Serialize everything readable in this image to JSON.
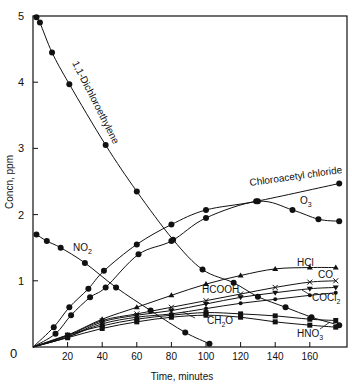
{
  "chart_data": {
    "type": "line",
    "title": "",
    "xlabel": "Time, minutes",
    "ylabel": "Concn, ppm",
    "xlim": [
      0,
      180
    ],
    "ylim": [
      0,
      5
    ],
    "x_ticks": [
      0,
      20,
      40,
      60,
      80,
      100,
      120,
      140,
      160
    ],
    "y_ticks": [
      1,
      2,
      3,
      4,
      5
    ],
    "grid": false,
    "series": [
      {
        "name": "1,1-Dichloroethylene",
        "marker": "circle",
        "x": [
          2,
          4,
          11,
          21,
          42,
          60,
          81,
          98,
          116,
          130,
          146,
          161,
          177
        ],
        "y": [
          4.98,
          4.9,
          4.45,
          3.97,
          3.05,
          2.35,
          1.62,
          1.17,
          0.97,
          0.76,
          0.6,
          0.45,
          0.33
        ]
      },
      {
        "name": "NO2",
        "marker": "circle",
        "x": [
          2,
          8,
          16,
          30,
          48,
          68,
          88,
          102
        ],
        "y": [
          1.7,
          1.6,
          1.5,
          1.27,
          0.9,
          0.55,
          0.22,
          0.05
        ]
      },
      {
        "name": "Chloroacetyl chloride",
        "marker": "circle",
        "x": [
          0,
          12,
          21,
          32,
          41,
          60,
          80,
          100,
          129,
          177
        ],
        "y": [
          0,
          0.3,
          0.6,
          0.88,
          1.15,
          1.55,
          1.85,
          2.07,
          2.2,
          2.47
        ]
      },
      {
        "name": "O3",
        "marker": "circle",
        "x": [
          0,
          13,
          22,
          33,
          42,
          61,
          80,
          100,
          130,
          150,
          165,
          177
        ],
        "y": [
          0,
          0.2,
          0.48,
          0.75,
          0.9,
          1.4,
          1.6,
          1.95,
          2.2,
          2.07,
          1.93,
          1.9
        ]
      },
      {
        "name": "HCl",
        "marker": "triangle",
        "x": [
          0,
          20,
          40,
          60,
          80,
          100,
          120,
          140,
          160,
          175
        ],
        "y": [
          0,
          0.18,
          0.42,
          0.6,
          0.78,
          0.95,
          1.08,
          1.18,
          1.2,
          1.2
        ]
      },
      {
        "name": "CO",
        "marker": "x",
        "x": [
          0,
          20,
          40,
          60,
          80,
          100,
          120,
          140,
          160,
          175
        ],
        "y": [
          0,
          0.17,
          0.4,
          0.5,
          0.6,
          0.7,
          0.8,
          0.9,
          0.98,
          1.0
        ]
      },
      {
        "name": "HCOOH",
        "marker": "triangle-down",
        "x": [
          0,
          20,
          40,
          60,
          80,
          100,
          120,
          140,
          160,
          175
        ],
        "y": [
          0,
          0.15,
          0.38,
          0.48,
          0.55,
          0.65,
          0.75,
          0.82,
          0.88,
          0.9
        ]
      },
      {
        "name": "COCl2",
        "marker": "small-circle",
        "x": [
          0,
          20,
          40,
          60,
          80,
          100,
          120,
          140,
          160,
          175
        ],
        "y": [
          0,
          0.15,
          0.35,
          0.45,
          0.5,
          0.58,
          0.66,
          0.72,
          0.78,
          0.82
        ]
      },
      {
        "name": "CH2O",
        "marker": "square",
        "x": [
          0,
          20,
          40,
          60,
          80,
          100,
          120,
          140,
          160,
          175
        ],
        "y": [
          0,
          0.18,
          0.32,
          0.42,
          0.48,
          0.52,
          0.5,
          0.47,
          0.42,
          0.4
        ]
      },
      {
        "name": "HNO3",
        "marker": "square",
        "x": [
          0,
          20,
          40,
          60,
          80,
          100,
          120,
          140,
          160,
          175
        ],
        "y": [
          0,
          0.14,
          0.28,
          0.38,
          0.45,
          0.48,
          0.45,
          0.38,
          0.33,
          0.3
        ]
      }
    ],
    "annotations": [
      {
        "text": "1,1-Dichloroethylene",
        "x": 24,
        "y": 4.0,
        "rotation": 62
      },
      {
        "text": "NO2",
        "x": 38,
        "y": 1.4
      },
      {
        "text": "Chloroacetyl chloride",
        "x": 118,
        "y": 2.35,
        "rotation": -10
      },
      {
        "text": "O3",
        "x": 153,
        "y": 2.12
      },
      {
        "text": "HCl",
        "x": 140,
        "y": 1.27
      },
      {
        "text": "CO",
        "x": 158,
        "y": 1.1
      },
      {
        "text": "HCOOH",
        "x": 88,
        "y": 0.9
      },
      {
        "text": "COCl2",
        "x": 150,
        "y": 0.62
      },
      {
        "text": "CH2O",
        "x": 82,
        "y": 0.33
      },
      {
        "text": "HNO3",
        "x": 150,
        "y": 0.12
      }
    ]
  },
  "labels": {
    "xlabel": "Time, minutes",
    "ylabel": "Concn, ppm",
    "zero": "0",
    "x_ticks": [
      "20",
      "40",
      "60",
      "80",
      "100",
      "120",
      "140",
      "160"
    ],
    "y_ticks": [
      "1",
      "2",
      "3",
      "4",
      "5"
    ],
    "curve_labels": {
      "dichloro": "1,1-Dichloroethylene",
      "no2": "NO",
      "no2_sub": "2",
      "chloroacetyl": "Chloroacetyl chloride",
      "o3": "O",
      "o3_sub": "3",
      "hcl": "HCl",
      "co": "CO",
      "hcooh": "HCOOH",
      "cocl2": "COCl",
      "cocl2_sub": "2",
      "ch2o": "CH",
      "ch2o_sub": "2",
      "ch2o_tail": "O",
      "hno3": "HNO",
      "hno3_sub": "3"
    }
  }
}
